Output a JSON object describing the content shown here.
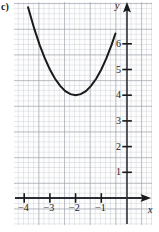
{
  "problem": {
    "label": "c)"
  },
  "axes": {
    "x_name": "x",
    "y_name": "y",
    "x_tick_labels": [
      "−4",
      "−3",
      "−2",
      "−1"
    ],
    "y_tick_labels": [
      "1",
      "2",
      "3",
      "4",
      "5",
      "6"
    ]
  },
  "chart_data": {
    "type": "line",
    "title": "",
    "subtitle": "",
    "xlabel": "x",
    "ylabel": "y",
    "grid": true,
    "grid_minor_step": 0.2,
    "grid_major_step": 1,
    "legend": "none",
    "xlim": [
      -4.6,
      0.95
    ],
    "ylim": [
      -0.9,
      7.8
    ],
    "xticks": [
      -4,
      -3,
      -2,
      -1
    ],
    "yticks": [
      1,
      2,
      3,
      4,
      5,
      6
    ],
    "xtick_labels": [
      "−4",
      "−3",
      "−2",
      "−1"
    ],
    "ytick_labels": [
      "1",
      "2",
      "3",
      "4",
      "5",
      "6"
    ],
    "curve": {
      "name": "parabola",
      "equation": "y = (x + 2)^2 + 4",
      "vertex": [
        -2,
        4
      ],
      "opens": "up",
      "color": "#1a1a1a",
      "x": [
        -3.85,
        -3.6,
        -3.4,
        -3.2,
        -3.0,
        -2.8,
        -2.6,
        -2.4,
        -2.2,
        -2.0,
        -1.8,
        -1.6,
        -1.4,
        -1.2,
        -1.0,
        -0.8,
        -0.6,
        -0.45
      ],
      "y": [
        7.42,
        6.56,
        5.96,
        5.44,
        5.0,
        4.64,
        4.36,
        4.16,
        4.04,
        4.0,
        4.04,
        4.16,
        4.36,
        4.64,
        5.0,
        5.44,
        5.96,
        6.4
      ]
    }
  }
}
